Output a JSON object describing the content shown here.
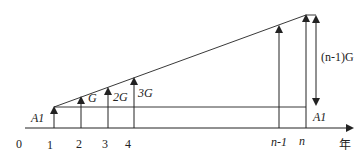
{
  "diagram": {
    "type": "cash-flow-gradient",
    "axis": {
      "origin_label": "0",
      "unit_label": "年",
      "ticks": [
        "1",
        "2",
        "3",
        "4",
        "n-1",
        "n"
      ]
    },
    "labels": {
      "base_amount_left": "A1",
      "base_amount_right": "A1",
      "gradient_1": "G",
      "gradient_2": "2G",
      "gradient_3": "3G",
      "gradient_total": "(n-1)G"
    },
    "colors": {
      "line": "#222222",
      "background": "#ffffff"
    }
  }
}
